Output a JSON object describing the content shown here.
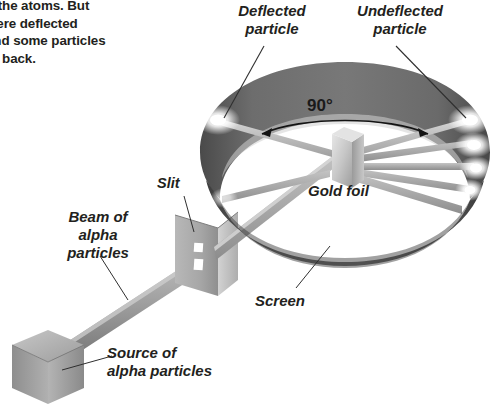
{
  "figure": {
    "body_text": "g the atoms. But\nwere deflected\nand some particles\nnt back.",
    "angle_label": "90°"
  },
  "labels": {
    "deflected_particle": "Deflected\nparticle",
    "undeflected_particle": "Undeflected\nparticle",
    "gold_foil": "Gold foil",
    "slit": "Slit",
    "beam_of_alpha_particles": "Beam of\nalpha\nparticles",
    "screen": "Screen",
    "source_of_alpha_particles": "Source of\nalpha particles"
  },
  "colors": {
    "background": "#ffffff",
    "text": "#231f20",
    "ring_dark": "#5b5b5b",
    "ring_darker": "#3f3f3f",
    "ring_light": "#a8a8a8",
    "beam_gray": "#9a9a9a",
    "beam_gray_dark": "#7d7d7d",
    "foil_gray": "#c9c9c9",
    "plate_gray": "#b4b4b4",
    "cube_gray": "#9f9f9f",
    "glow": "#ffffff",
    "leader_line": "#3a3a3a"
  },
  "elements": {
    "screen_ring": "circular detector screen ring",
    "gold_foil_plate": "small square gold foil target at ring center",
    "slit_plate": "upright plate with two narrow slits",
    "alpha_source_cube": "lead box source of alpha particles",
    "beam": "collimated beam of alpha particles",
    "glow_spots": "bright scintillation flashes on screen",
    "angle_arc": "90 degree double headed arc arrow"
  }
}
